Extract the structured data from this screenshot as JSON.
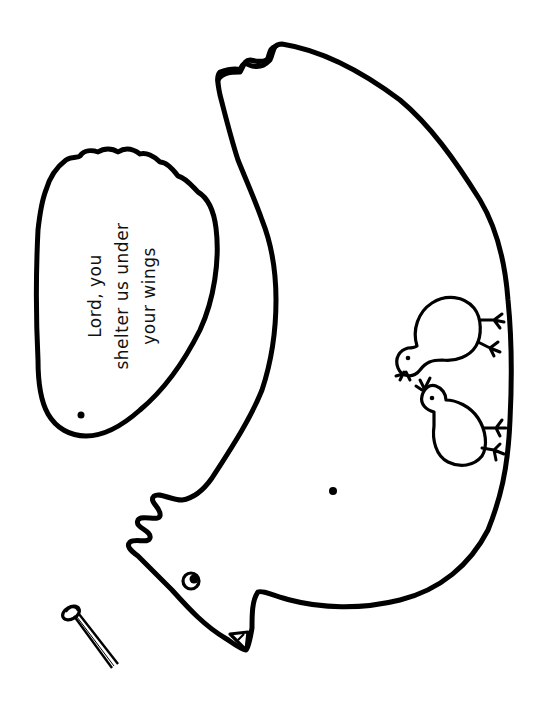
{
  "illustration": {
    "subject": "hen craft cutout with wing and paper fastener",
    "colors": {
      "line": "#000000",
      "background": "#ffffff"
    },
    "wing": {
      "text_lines": [
        "Lord, you",
        "shelter us under",
        "your wings"
      ],
      "has_pivot_dot": true
    },
    "hen": {
      "has_eye": true,
      "has_beak": true,
      "has_comb": true,
      "has_pivot_dot": true,
      "chicks_count": 2
    },
    "fastener": {
      "type": "paper fastener (split pin)"
    }
  }
}
